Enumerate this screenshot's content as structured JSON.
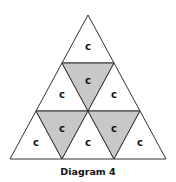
{
  "diagram": {
    "caption": "Diagram 4",
    "colors": {
      "stroke": "#333333",
      "unshaded": "#ffffff",
      "shaded": "#c8c8c8"
    },
    "cells": [
      {
        "row": 1,
        "position": "up-1",
        "label": "c",
        "shaded": false
      },
      {
        "row": 2,
        "position": "up-1",
        "label": "c",
        "shaded": false
      },
      {
        "row": 2,
        "position": "down-1",
        "label": "c",
        "shaded": true
      },
      {
        "row": 2,
        "position": "up-2",
        "label": "c",
        "shaded": false
      },
      {
        "row": 3,
        "position": "up-1",
        "label": "c",
        "shaded": false
      },
      {
        "row": 3,
        "position": "down-1",
        "label": "c",
        "shaded": true
      },
      {
        "row": 3,
        "position": "up-2",
        "label": "c",
        "shaded": false
      },
      {
        "row": 3,
        "position": "down-2",
        "label": "c",
        "shaded": true
      },
      {
        "row": 3,
        "position": "up-3",
        "label": "c",
        "shaded": false
      }
    ]
  }
}
